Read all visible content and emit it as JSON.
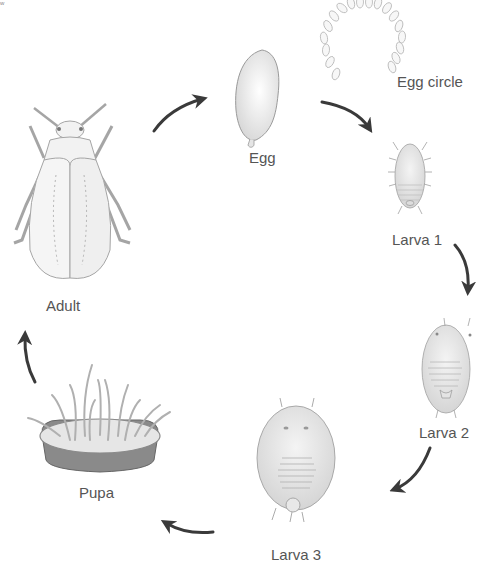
{
  "diagram": {
    "type": "life-cycle",
    "corner_mark": "w",
    "colors": {
      "arrow": "#3a3a3a",
      "label": "#555555",
      "outline": "#9a9a9a",
      "fill": "#eeeeee",
      "pupa_rim": "#7a7a7a"
    },
    "stages": [
      {
        "id": "egg",
        "label": "Egg"
      },
      {
        "id": "egg-circle",
        "label": "Egg circle"
      },
      {
        "id": "larva-1",
        "label": "Larva 1"
      },
      {
        "id": "larva-2",
        "label": "Larva 2"
      },
      {
        "id": "larva-3",
        "label": "Larva 3"
      },
      {
        "id": "pupa",
        "label": "Pupa"
      },
      {
        "id": "adult",
        "label": "Adult"
      }
    ],
    "arrows": [
      {
        "from": "adult",
        "to": "egg"
      },
      {
        "from": "egg",
        "to": "larva-1"
      },
      {
        "from": "larva-1",
        "to": "larva-2"
      },
      {
        "from": "larva-2",
        "to": "larva-3"
      },
      {
        "from": "larva-3",
        "to": "pupa"
      },
      {
        "from": "pupa",
        "to": "adult"
      }
    ]
  }
}
